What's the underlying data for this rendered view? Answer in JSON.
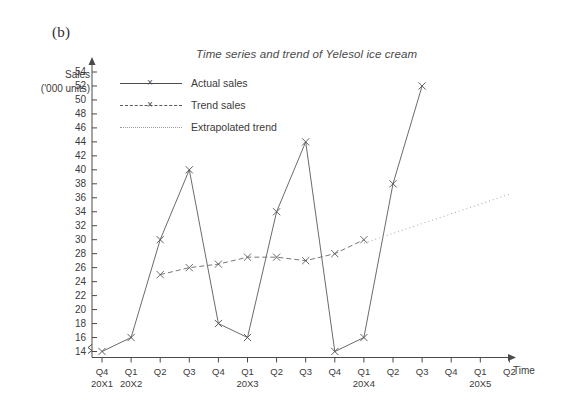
{
  "figure": {
    "panel_label": "(b)",
    "title": "Time series and trend of Yelesol ice cream",
    "y_axis_label_line1": "Sales",
    "y_axis_label_line2": "('000 units)",
    "x_axis_label": "Time"
  },
  "legend": {
    "items": [
      {
        "label": "Actual sales",
        "style": "solid",
        "marker": "x",
        "color": "#4c4c4c"
      },
      {
        "label": "Trend sales",
        "style": "dashed",
        "marker": "x",
        "color": "#5a5a5a"
      },
      {
        "label": "Extrapolated trend",
        "style": "dotted",
        "marker": "none",
        "color": "#9a9a9a"
      }
    ]
  },
  "chart_data": {
    "type": "line",
    "title": "Time series and trend of Yelesol ice cream",
    "xlabel": "Time",
    "ylabel": "Sales ('000 units)",
    "ylim": [
      13,
      55
    ],
    "y_axis_broken": true,
    "y_ticks": [
      14,
      16,
      18,
      20,
      22,
      24,
      26,
      28,
      30,
      32,
      34,
      36,
      38,
      40,
      42,
      44,
      46,
      48,
      50,
      52,
      54
    ],
    "grid": false,
    "legend_position": "top-left-inside",
    "categories": [
      "Q4 20X1",
      "Q1 20X2",
      "Q2 20X2",
      "Q3 20X2",
      "Q4 20X2",
      "Q1 20X3",
      "Q2 20X3",
      "Q3 20X3",
      "Q4 20X3",
      "Q1 20X4",
      "Q2 20X4",
      "Q3 20X4",
      "Q4 20X4",
      "Q1 20X5",
      "Q2 20X5"
    ],
    "x_tick_quarters": [
      "Q4",
      "Q1",
      "Q2",
      "Q3",
      "Q4",
      "Q1",
      "Q2",
      "Q3",
      "Q4",
      "Q1",
      "Q2",
      "Q3",
      "Q4",
      "Q1",
      "Q2"
    ],
    "x_tick_years": [
      {
        "label": "20X1",
        "at_index": 0
      },
      {
        "label": "20X2",
        "at_index": 1
      },
      {
        "label": "20X3",
        "at_index": 5
      },
      {
        "label": "20X4",
        "at_index": 9
      },
      {
        "label": "20X5",
        "at_index": 13
      }
    ],
    "series": [
      {
        "name": "Actual sales",
        "style": "solid",
        "marker": "x",
        "points": [
          {
            "x": "Q4 20X1",
            "index": 0,
            "y": 14
          },
          {
            "x": "Q1 20X2",
            "index": 1,
            "y": 16
          },
          {
            "x": "Q2 20X2",
            "index": 2,
            "y": 30
          },
          {
            "x": "Q3 20X2",
            "index": 3,
            "y": 40
          },
          {
            "x": "Q4 20X2",
            "index": 4,
            "y": 18
          },
          {
            "x": "Q1 20X3",
            "index": 5,
            "y": 16
          },
          {
            "x": "Q2 20X3",
            "index": 6,
            "y": 34
          },
          {
            "x": "Q3 20X3",
            "index": 7,
            "y": 44
          },
          {
            "x": "Q4 20X3",
            "index": 8,
            "y": 14
          },
          {
            "x": "Q1 20X4",
            "index": 9,
            "y": 16
          },
          {
            "x": "Q2 20X4",
            "index": 10,
            "y": 38
          },
          {
            "x": "Q3 20X4",
            "index": 11,
            "y": 52
          }
        ]
      },
      {
        "name": "Trend sales",
        "style": "dashed",
        "marker": "x",
        "points": [
          {
            "x": "Q2 20X2",
            "index": 2,
            "y": 25
          },
          {
            "x": "Q3 20X2",
            "index": 3,
            "y": 26
          },
          {
            "x": "Q4 20X2",
            "index": 4,
            "y": 26.5
          },
          {
            "x": "Q1 20X3",
            "index": 5,
            "y": 27.5
          },
          {
            "x": "Q2 20X3",
            "index": 6,
            "y": 27.5
          },
          {
            "x": "Q3 20X3",
            "index": 7,
            "y": 27
          },
          {
            "x": "Q4 20X3",
            "index": 8,
            "y": 28
          },
          {
            "x": "Q1 20X4",
            "index": 9,
            "y": 30
          }
        ]
      },
      {
        "name": "Extrapolated trend",
        "style": "dotted",
        "marker": "none",
        "points": [
          {
            "x": "Q1 20X4",
            "index": 9,
            "y": 29.5
          },
          {
            "x": "Q2 20X5",
            "index": 14,
            "y": 36.5
          }
        ]
      }
    ]
  }
}
